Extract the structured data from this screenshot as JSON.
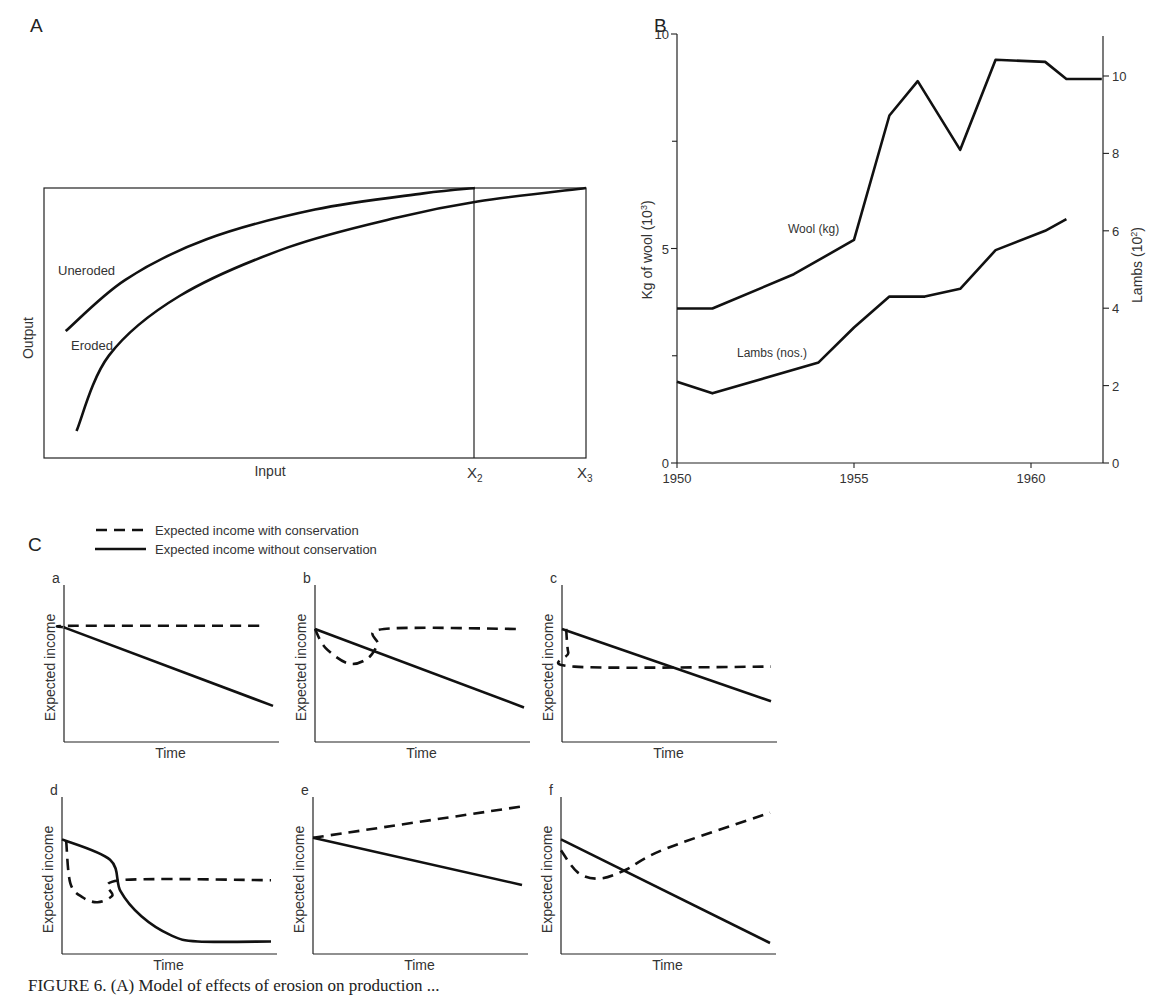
{
  "figure": {
    "caption_partial": "FIGURE 6. (A) Model of effects of erosion on production ..."
  },
  "chart_data": [
    {
      "panel": "A",
      "type": "line",
      "title": "",
      "xlabel": "Input",
      "ylabel": "Output",
      "x_tick_labels": [
        "X2",
        "X3"
      ],
      "grid": false,
      "frame": true,
      "series": [
        {
          "name": "Uneroded",
          "style": "solid",
          "description": "concave increasing curve reaching maximum output at X2",
          "points": [
            [
              0.04,
              0.47
            ],
            [
              0.15,
              0.66
            ],
            [
              0.3,
              0.81
            ],
            [
              0.5,
              0.92
            ],
            [
              0.7,
              0.98
            ],
            [
              0.795,
              1.0
            ]
          ]
        },
        {
          "name": "Eroded",
          "style": "solid",
          "description": "concave increasing curve below uneroded, reaching same maximum at X3",
          "points": [
            [
              0.06,
              0.1
            ],
            [
              0.12,
              0.38
            ],
            [
              0.25,
              0.6
            ],
            [
              0.45,
              0.78
            ],
            [
              0.65,
              0.89
            ],
            [
              0.8,
              0.95
            ],
            [
              1.0,
              1.0
            ]
          ]
        }
      ],
      "annotations": [
        "Vertical line at X2",
        "Vertical line at X3"
      ]
    },
    {
      "panel": "B",
      "type": "line",
      "title": "",
      "xlabel": "",
      "ylabel": "Kg of wool (10³)",
      "ylabel_right": "Lambs (10²)",
      "x_ticks": [
        1950,
        1955,
        1960
      ],
      "xlim": [
        1950,
        1962
      ],
      "ylim": [
        0,
        10
      ],
      "y_ticks": [
        0,
        5,
        10
      ],
      "y_minor_ticks": [
        2.5,
        7.5
      ],
      "ylim_right": [
        0,
        11
      ],
      "y_ticks_right": [
        0,
        2,
        4,
        6,
        8,
        10
      ],
      "grid": false,
      "series": [
        {
          "name": "Wool (kg)",
          "axis": "left",
          "x": [
            1950,
            1951,
            1953.3,
            1955,
            1956,
            1956.8,
            1958,
            1959,
            1960.4,
            1961,
            1962
          ],
          "values": [
            3.6,
            3.6,
            4.4,
            5.2,
            8.1,
            8.9,
            7.3,
            9.4,
            9.35,
            8.95,
            8.95
          ]
        },
        {
          "name": "Lambs (nos.)",
          "axis": "right",
          "x": [
            1950,
            1951,
            1954,
            1955,
            1956,
            1957,
            1958,
            1959,
            1960.4,
            1961
          ],
          "values": [
            2.1,
            1.8,
            2.6,
            3.5,
            4.3,
            4.3,
            4.5,
            5.5,
            6.0,
            6.3
          ]
        }
      ]
    },
    {
      "panel": "C",
      "type": "line",
      "legend": [
        {
          "style": "dashed",
          "label": "Expected income with conservation"
        },
        {
          "style": "solid",
          "label": "Expected income without conservation"
        }
      ],
      "subplots": [
        {
          "id": "a",
          "xlabel": "Time",
          "ylabel": "Expected income",
          "solid": [
            [
              0,
              0.73
            ],
            [
              1,
              0.23
            ]
          ],
          "dashed": [
            [
              0,
              0.73
            ],
            [
              0.05,
              0.74
            ],
            [
              0.95,
              0.74
            ]
          ]
        },
        {
          "id": "b",
          "xlabel": "Time",
          "ylabel": "Expected income",
          "solid": [
            [
              0,
              0.72
            ],
            [
              1,
              0.22
            ]
          ],
          "dashed": [
            [
              0,
              0.72
            ],
            [
              0.05,
              0.6
            ],
            [
              0.16,
              0.5
            ],
            [
              0.25,
              0.53
            ],
            [
              0.3,
              0.62
            ],
            [
              0.33,
              0.72
            ],
            [
              0.98,
              0.72
            ]
          ]
        },
        {
          "id": "c",
          "xlabel": "Time",
          "ylabel": "Expected income",
          "solid": [
            [
              0,
              0.72
            ],
            [
              1,
              0.26
            ]
          ],
          "dashed": [
            [
              0.02,
              0.72
            ],
            [
              0.03,
              0.57
            ],
            [
              0.06,
              0.48
            ],
            [
              1.0,
              0.48
            ]
          ]
        },
        {
          "id": "d",
          "xlabel": "Time",
          "ylabel": "Expected income",
          "solid": [
            [
              0,
              0.73
            ],
            [
              0.23,
              0.6
            ],
            [
              0.28,
              0.4
            ],
            [
              0.38,
              0.24
            ],
            [
              0.52,
              0.12
            ],
            [
              0.65,
              0.08
            ],
            [
              1.0,
              0.08
            ]
          ],
          "dashed": [
            [
              0.02,
              0.72
            ],
            [
              0.04,
              0.45
            ],
            [
              0.1,
              0.36
            ],
            [
              0.17,
              0.33
            ],
            [
              0.24,
              0.37
            ],
            [
              0.28,
              0.47
            ],
            [
              1.0,
              0.47
            ]
          ]
        },
        {
          "id": "e",
          "xlabel": "Time",
          "ylabel": "Expected income",
          "solid": [
            [
              0,
              0.74
            ],
            [
              1,
              0.44
            ]
          ],
          "dashed": [
            [
              0,
              0.74
            ],
            [
              1,
              0.94
            ]
          ]
        },
        {
          "id": "f",
          "xlabel": "Time",
          "ylabel": "Expected income",
          "solid": [
            [
              0,
              0.73
            ],
            [
              1,
              0.07
            ]
          ],
          "dashed": [
            [
              0,
              0.66
            ],
            [
              0.08,
              0.52
            ],
            [
              0.18,
              0.48
            ],
            [
              0.3,
              0.53
            ],
            [
              0.5,
              0.67
            ],
            [
              1.0,
              0.9
            ]
          ]
        }
      ]
    }
  ],
  "labels": {
    "panel_a": "A",
    "panel_b": "B",
    "panel_c": "C",
    "a_ylabel": "Output",
    "a_xlabel": "Input",
    "a_uneroded": "Uneroded",
    "a_eroded": "Eroded",
    "a_x2": "X",
    "a_x2_sub": "2",
    "a_x3": "X",
    "a_x3_sub": "3",
    "b_ylabel": "Kg of wool (10",
    "b_ylabel_sup": "3",
    "b_ylabel_end": ")",
    "b_ylabel_right": "Lambs (10",
    "b_ylabel_right_sup": "2",
    "b_ylabel_right_end": ")",
    "b_wool": "Wool (kg)",
    "b_lambs": "Lambs (nos.)",
    "c_legend_dashed": "Expected income with conservation",
    "c_legend_solid": "Expected income without conservation",
    "c_ylabel": "Expected income",
    "c_xlabel": "Time"
  }
}
